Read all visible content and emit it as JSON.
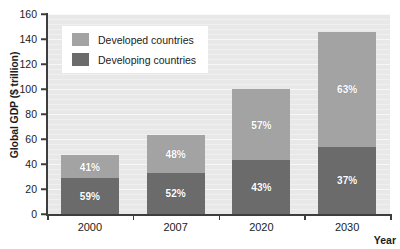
{
  "chart_data": {
    "type": "bar",
    "subtype": "stacked-bar",
    "title": "",
    "xlabel": "Year",
    "ylabel": "Global GDP ($ trillion)",
    "categories": [
      "2000",
      "2007",
      "2020",
      "2030"
    ],
    "ylim": [
      0,
      160
    ],
    "yticks": [
      0,
      20,
      40,
      60,
      80,
      100,
      120,
      140,
      160
    ],
    "grid": true,
    "legend_position": "upper-left-inside",
    "series": [
      {
        "name": "Developing countries",
        "color": "#6b6b6b",
        "values": [
          29,
          33,
          43,
          54
        ],
        "data_labels": [
          "59%",
          "52%",
          "43%",
          "37%"
        ]
      },
      {
        "name": "Developed countries",
        "color": "#a3a3a3",
        "values": [
          18,
          30,
          57,
          92
        ],
        "data_labels": [
          "41%",
          "48%",
          "57%",
          "63%"
        ]
      }
    ],
    "totals": [
      47,
      63,
      100,
      146
    ]
  },
  "axes": {
    "y_title": "Global GDP ($ trillion)",
    "x_title": "Year",
    "y_tick_labels": [
      "160",
      "140",
      "120",
      "100",
      "80",
      "60",
      "40",
      "20",
      "0"
    ],
    "x_tick_labels": [
      "2000",
      "2007",
      "2020",
      "2030"
    ]
  },
  "legend": {
    "items": [
      {
        "label": "Developed countries",
        "color": "#a3a3a3"
      },
      {
        "label": "Developing countries",
        "color": "#6b6b6b"
      }
    ]
  }
}
